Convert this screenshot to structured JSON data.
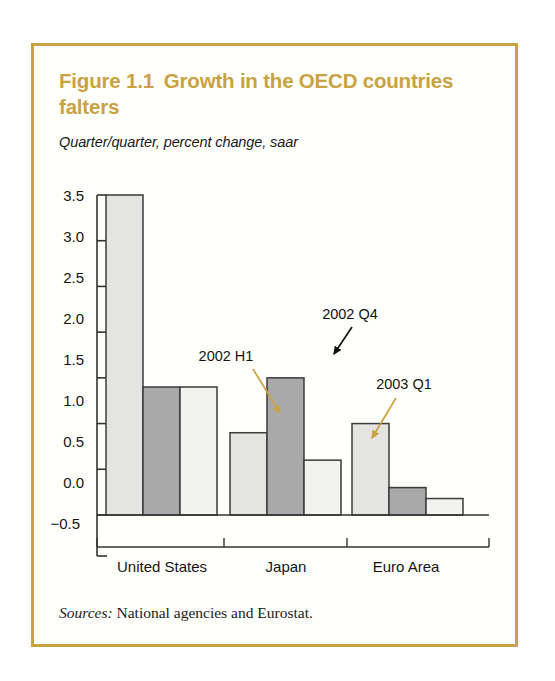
{
  "figure": {
    "number": "Figure 1.1",
    "title": "Growth in the OECD countries falters",
    "subtitle": "Quarter/quarter, percent change, saar",
    "source_lead": "Sources:",
    "source_text": "National agencies and Eurostat.",
    "frame_color": "#c9a241",
    "title_color": "#c9a241"
  },
  "chart_data": {
    "type": "bar",
    "subtitle": "Quarter/quarter, percent change, saar",
    "xlabel": "",
    "ylabel": "",
    "ylim": [
      -0.5,
      3.5
    ],
    "ytick_labels": [
      "3.5",
      "3.0",
      "2.5",
      "2.0",
      "1.5",
      "1.0",
      "0.5",
      "0.0",
      "−0.5"
    ],
    "yticks": [
      3.5,
      3.0,
      2.5,
      2.0,
      1.5,
      1.0,
      0.5,
      0.0,
      -0.5
    ],
    "grid": false,
    "legend": "none",
    "categories": [
      "United States",
      "Japan",
      "Euro Area"
    ],
    "series": [
      {
        "name": "2002 H1",
        "color": "#e4e4e2",
        "values": [
          3.5,
          0.9,
          1.0
        ]
      },
      {
        "name": "2002 Q4",
        "color": "#a9a9a9",
        "values": [
          1.4,
          1.5,
          0.3
        ]
      },
      {
        "name": "2003 Q1",
        "color": "#f2f2f0",
        "values": [
          1.4,
          0.6,
          0.18
        ]
      }
    ],
    "annotations": [
      {
        "label": "2002 H1",
        "arrow_color": "#c9a241",
        "target_series": "2002 H1",
        "target_category": "Japan"
      },
      {
        "label": "2002 Q4",
        "arrow_color": "#111111",
        "target_series": "2002 Q4",
        "target_category": "Japan"
      },
      {
        "label": "2003 Q1",
        "arrow_color": "#c9a241",
        "target_series": "2003 Q1",
        "target_category": "Japan"
      }
    ]
  },
  "axis": {
    "ytick_0": "3.5",
    "ytick_1": "3.0",
    "ytick_2": "2.5",
    "ytick_3": "2.0",
    "ytick_4": "1.5",
    "ytick_5": "1.0",
    "ytick_6": "0.5",
    "ytick_7": "0.0",
    "ytick_8": "−0.5",
    "cat_0": "United States",
    "cat_1": "Japan",
    "cat_2": "Euro Area"
  },
  "annotation_labels": {
    "a0": "2002 H1",
    "a1": "2002 Q4",
    "a2": "2003 Q1"
  }
}
